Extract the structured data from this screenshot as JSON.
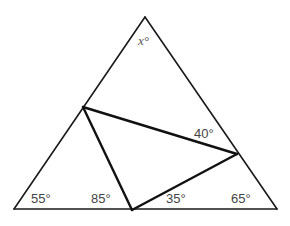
{
  "diagram": {
    "type": "geometry-triangle",
    "outer_triangle": {
      "apex": [
        145,
        17
      ],
      "bottom_left": [
        14,
        209
      ],
      "bottom_right": [
        277,
        209
      ]
    },
    "inner_triangle": {
      "left_point": [
        83,
        107
      ],
      "right_point": [
        237,
        154
      ],
      "bottom_point": [
        132,
        210
      ]
    },
    "labels": {
      "apex_angle": "x°",
      "bottom_left_angle": "55°",
      "bottom_mid_left_angle": "85°",
      "bottom_mid_right_angle": "35°",
      "bottom_right_angle": "65°",
      "right_inner_angle": "40°"
    }
  }
}
